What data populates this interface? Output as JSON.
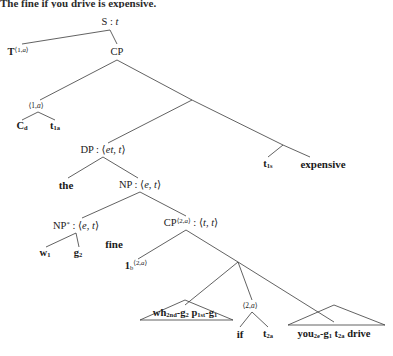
{
  "caption": {
    "text": "The fine if you drive is expensive."
  },
  "diagram": {
    "kind": "syntax-tree",
    "background": "#ffffff",
    "line_color": "#3a3a3a",
    "nodes": [
      {
        "id": "s",
        "label_html": "S : <i>t</i>",
        "x": 110,
        "y": 22,
        "cls": "lbl"
      },
      {
        "id": "t1a",
        "label_html": "<b>T</b><sup>&#10216;1,<i>a</i>&#10217;</sup>",
        "x": 18,
        "y": 52,
        "cls": "lbl"
      },
      {
        "id": "cp",
        "label_html": "CP",
        "x": 117,
        "y": 52,
        "cls": "lbl"
      },
      {
        "id": "idx1a",
        "label_html": "&#10216;1,<i>a</i>&#10217;",
        "x": 36,
        "y": 106,
        "cls": "lbl-sm"
      },
      {
        "id": "cd",
        "label_html": "<b>C</b><sub>d</sub>",
        "x": 22,
        "y": 126,
        "cls": "leaf"
      },
      {
        "id": "t1a_leaf",
        "label_html": "<b>t</b><sub>1a</sub>",
        "x": 55,
        "y": 126,
        "cls": "leaf"
      },
      {
        "id": "mid",
        "label_html": "",
        "x": 192,
        "y": 100,
        "cls": "lbl"
      },
      {
        "id": "dp",
        "label_html": "DP : &#10216;<i>et</i>, <i>t</i>&#10217;",
        "x": 103,
        "y": 150,
        "cls": "lbl"
      },
      {
        "id": "right2",
        "label_html": "",
        "x": 283,
        "y": 145,
        "cls": "lbl"
      },
      {
        "id": "t1s",
        "label_html": "<b>t</b><sub>1s</sub>",
        "x": 268,
        "y": 164,
        "cls": "leaf"
      },
      {
        "id": "expensive",
        "label_html": "expensive",
        "x": 323,
        "y": 164,
        "cls": "leaf-lg"
      },
      {
        "id": "the",
        "label_html": "the",
        "x": 66,
        "y": 185,
        "cls": "leaf-lg"
      },
      {
        "id": "np",
        "label_html": "NP : &#10216;<i>e</i>, <i>t</i>&#10217;",
        "x": 140,
        "y": 185,
        "cls": "lbl"
      },
      {
        "id": "npstar",
        "label_html": "NP<sup>&#42;</sup> : &#10216;<i>e</i>, <i>t</i>&#10217;",
        "x": 76,
        "y": 226,
        "cls": "lbl"
      },
      {
        "id": "cp2a",
        "label_html": "CP<sup>&#10216;2,<i>a</i>&#10217;</sup> : &#10216;<i>t</i>, <i>t</i>&#10217;",
        "x": 191,
        "y": 223,
        "cls": "lbl"
      },
      {
        "id": "w1",
        "label_html": "<b>w</b><sub>1</sub>",
        "x": 45,
        "y": 253,
        "cls": "leaf"
      },
      {
        "id": "g2",
        "label_html": "<b>g</b><sub>2</sub>",
        "x": 78,
        "y": 253,
        "cls": "leaf"
      },
      {
        "id": "fine",
        "label_html": "fine",
        "x": 114,
        "y": 244,
        "cls": "leaf-lg"
      },
      {
        "id": "lam",
        "label_html": "<b>1</b><sub>b</sub><sup>&#10216;2,<i>a</i>&#10217;</sup>",
        "x": 136,
        "y": 266,
        "cls": "lbl"
      },
      {
        "id": "low",
        "label_html": "",
        "x": 238,
        "y": 262,
        "cls": "lbl"
      },
      {
        "id": "whstr",
        "label_html": "<b>wh</b><sub>2nd</sub>-<b>g</b><sub>2</sub> <b>p</b><sub>1st</sub>-<b>g</b><sub>1</sub>",
        "x": 185,
        "y": 313,
        "cls": "leaf"
      },
      {
        "id": "idx2a",
        "label_html": "&#10216;2,<i>a</i>&#10217;",
        "x": 250,
        "y": 306,
        "cls": "lbl-sm"
      },
      {
        "id": "if",
        "label_html": "if",
        "x": 240,
        "y": 334,
        "cls": "leaf-lg"
      },
      {
        "id": "t2a",
        "label_html": "<b>t</b><sub>2a</sub>",
        "x": 268,
        "y": 334,
        "cls": "leaf"
      },
      {
        "id": "youstr",
        "label_html": "<b>you</b><sub>2e</sub>-<b>g</b><sub>1</sub> <b>t</b><sub>2a</sub> <b>drive</b>",
        "x": 334,
        "y": 334,
        "cls": "leaf"
      }
    ],
    "edges": [
      {
        "from": "s",
        "to": "t1a",
        "x1": 110,
        "y1": 30,
        "x2": 22,
        "y2": 44
      },
      {
        "from": "s",
        "to": "cp",
        "x1": 110,
        "y1": 30,
        "x2": 117,
        "y2": 44
      },
      {
        "from": "cp",
        "to": "idx1a",
        "x1": 117,
        "y1": 60,
        "x2": 40,
        "y2": 100
      },
      {
        "from": "cp",
        "to": "mid",
        "x1": 117,
        "y1": 60,
        "x2": 192,
        "y2": 100
      },
      {
        "from": "idx1a",
        "to": "cd",
        "x1": 38,
        "y1": 112,
        "x2": 22,
        "y2": 120
      },
      {
        "from": "idx1a",
        "to": "t1a_leaf",
        "x1": 38,
        "y1": 112,
        "x2": 55,
        "y2": 120
      },
      {
        "from": "mid",
        "to": "dp",
        "x1": 192,
        "y1": 100,
        "x2": 108,
        "y2": 143
      },
      {
        "from": "mid",
        "to": "right2",
        "x1": 192,
        "y1": 100,
        "x2": 283,
        "y2": 145
      },
      {
        "from": "right2",
        "to": "t1s",
        "x1": 283,
        "y1": 145,
        "x2": 268,
        "y2": 157
      },
      {
        "from": "right2",
        "to": "expensive",
        "x1": 283,
        "y1": 145,
        "x2": 310,
        "y2": 157
      },
      {
        "from": "dp",
        "to": "the",
        "x1": 103,
        "y1": 157,
        "x2": 68,
        "y2": 178
      },
      {
        "from": "dp",
        "to": "np",
        "x1": 103,
        "y1": 157,
        "x2": 138,
        "y2": 178
      },
      {
        "from": "np",
        "to": "npstar",
        "x1": 140,
        "y1": 192,
        "x2": 82,
        "y2": 218
      },
      {
        "from": "np",
        "to": "cp2a",
        "x1": 140,
        "y1": 192,
        "x2": 186,
        "y2": 216
      },
      {
        "from": "npstar",
        "to": "w1",
        "x1": 76,
        "y1": 233,
        "x2": 46,
        "y2": 247
      },
      {
        "from": "npstar",
        "to": "g2",
        "x1": 76,
        "y1": 233,
        "x2": 79,
        "y2": 247
      },
      {
        "from": "cp2a",
        "to": "lam",
        "x1": 186,
        "y1": 230,
        "x2": 138,
        "y2": 259
      },
      {
        "from": "cp2a",
        "to": "low",
        "x1": 186,
        "y1": 230,
        "x2": 238,
        "y2": 262
      },
      {
        "from": "low",
        "to": "whstr",
        "x1": 238,
        "y1": 262,
        "x2": 185,
        "y2": 305
      },
      {
        "from": "low",
        "to": "idx2a",
        "x1": 238,
        "y1": 262,
        "x2": 252,
        "y2": 300
      },
      {
        "from": "low",
        "to": "youstr",
        "x1": 238,
        "y1": 262,
        "x2": 334,
        "y2": 322
      },
      {
        "from": "idx2a",
        "to": "if",
        "x1": 252,
        "y1": 312,
        "x2": 240,
        "y2": 327
      },
      {
        "from": "idx2a",
        "to": "t2a",
        "x1": 252,
        "y1": 312,
        "x2": 268,
        "y2": 327
      }
    ],
    "triangles": [
      {
        "name": "wh-string-triangle",
        "apex_x": 185,
        "apex_y": 300,
        "left_x": 140,
        "right_x": 233,
        "base_y": 320
      },
      {
        "name": "you-string-triangle",
        "apex_x": 334,
        "apex_y": 305,
        "left_x": 288,
        "right_x": 385,
        "base_y": 325
      }
    ]
  }
}
